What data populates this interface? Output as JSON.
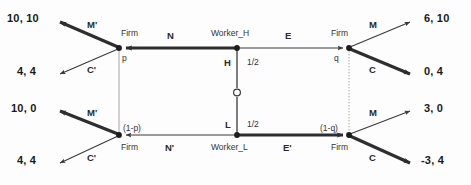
{
  "figure": {
    "type": "extensive-form-game-tree"
  },
  "chance_node": {
    "name": "nature",
    "branches": [
      {
        "label": "H",
        "probability": "1/2"
      },
      {
        "label": "L",
        "probability": "1/2"
      }
    ]
  },
  "nodes": {
    "worker_h": {
      "label": "Worker_H"
    },
    "worker_l": {
      "label": "Worker_L"
    },
    "firm_top_left": {
      "label": "Firm",
      "belief": "p"
    },
    "firm_bottom_left": {
      "label": "Firm",
      "belief": "(1-p)"
    },
    "firm_top_right": {
      "label": "Firm",
      "belief": "q"
    },
    "firm_bottom_right": {
      "label": "Firm",
      "belief": "(1-q)"
    }
  },
  "edges": {
    "worker_h_left": "N",
    "worker_h_right": "E",
    "worker_l_left": "N'",
    "worker_l_right": "E'",
    "firm_top_left_up": "M'",
    "firm_top_left_down": "C'",
    "firm_bottom_left_up": "M'",
    "firm_bottom_left_down": "C'",
    "firm_top_right_up": "M",
    "firm_top_right_down": "C",
    "firm_bottom_right_up": "M",
    "firm_bottom_right_down": "C"
  },
  "payoffs": {
    "top_left_upper": "10, 10",
    "top_left_lower": "4, 4",
    "bottom_left_upper": "10, 0",
    "bottom_left_lower": "4, 4",
    "top_right_upper": "6, 10",
    "top_right_lower": "0, 4",
    "bottom_right_upper": "3, 0",
    "bottom_right_lower": "-3, 4"
  },
  "colors": {
    "line": "#3a3a3a",
    "bold_line": "#2e2e2e",
    "info_set": "#9a9a9a",
    "text": "#1a1a1a",
    "background": "#fdfdfd"
  }
}
